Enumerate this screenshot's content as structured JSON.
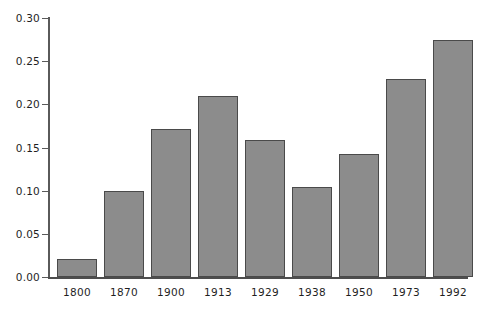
{
  "chart_data": {
    "type": "bar",
    "title": "",
    "subtitle": "",
    "xlabel": "",
    "ylabel": "",
    "categories": [
      "1800",
      "1870",
      "1900",
      "1913",
      "1929",
      "1938",
      "1950",
      "1973",
      "1992"
    ],
    "values": [
      0.021,
      0.1,
      0.172,
      0.21,
      0.159,
      0.104,
      0.142,
      0.229,
      0.275
    ],
    "ylim": [
      0.0,
      0.3
    ],
    "yticks": [
      "0.00",
      "0.05",
      "0.10",
      "0.15",
      "0.20",
      "0.25",
      "0.30"
    ],
    "ytick_values": [
      0.0,
      0.05,
      0.1,
      0.15,
      0.2,
      0.25,
      0.3
    ],
    "grid": false,
    "legend": "none",
    "bar_color": "#8c8c8c",
    "bar_edge_color": "#4a4a4a",
    "axis_color": "#5a5a5a",
    "background_color": "#ffffff"
  }
}
